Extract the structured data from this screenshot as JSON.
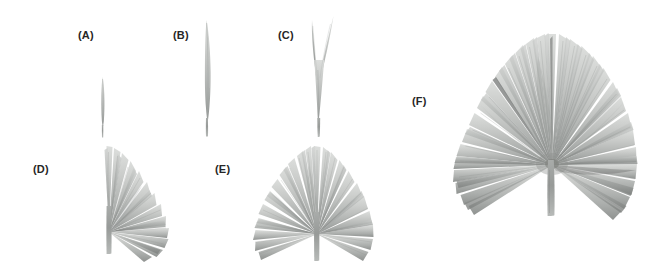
{
  "figure": {
    "background_color": "#ffffff",
    "width": 671,
    "height": 267,
    "label_color": "#262626",
    "label_font_size_px": 11
  },
  "palette": {
    "blade_light": "#d3d5d3",
    "blade_mid": "#b9bcb9",
    "blade_dark": "#9a9d9b",
    "blade_darkest": "#7e817f",
    "petiole_light": "#c2c4c2",
    "petiole_dark": "#8e918f",
    "vein": "#aaadab"
  },
  "panels": [
    {
      "id": "a",
      "label": "(A)",
      "label_x": 78,
      "label_y": 29,
      "specimen_x": 88,
      "specimen_y": 75,
      "specimen_w": 30,
      "specimen_h": 70,
      "segment_count": 1,
      "kind": "strap-eophyll"
    },
    {
      "id": "b",
      "label": "(B)",
      "label_x": 173,
      "label_y": 29,
      "specimen_x": 185,
      "specimen_y": 18,
      "specimen_w": 42,
      "specimen_h": 128,
      "segment_count": 1,
      "kind": "entire-lanceolate-blade"
    },
    {
      "id": "c",
      "label": "(C)",
      "label_x": 278,
      "label_y": 29,
      "specimen_x": 290,
      "specimen_y": 14,
      "specimen_w": 62,
      "specimen_h": 132,
      "segment_count": 3,
      "kind": "bifid-blade"
    },
    {
      "id": "d",
      "label": "(D)",
      "label_x": 33,
      "label_y": 163,
      "specimen_x": 82,
      "specimen_y": 140,
      "specimen_w": 120,
      "specimen_h": 122,
      "segment_count": 14,
      "kind": "asymmetric-palmate-fan"
    },
    {
      "id": "e",
      "label": "(E)",
      "label_x": 215,
      "label_y": 163,
      "specimen_x": 237,
      "specimen_y": 142,
      "specimen_w": 160,
      "specimen_h": 122,
      "segment_count": 20,
      "kind": "symmetric-palmate-fan"
    },
    {
      "id": "f",
      "label": "(F)",
      "label_x": 412,
      "label_y": 95,
      "specimen_x": 440,
      "specimen_y": 30,
      "specimen_w": 230,
      "specimen_h": 200,
      "segment_count": 28,
      "kind": "mature-palmate-fan"
    }
  ]
}
